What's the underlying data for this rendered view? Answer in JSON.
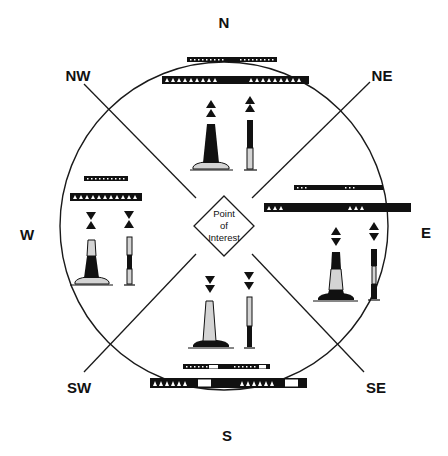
{
  "diagram": {
    "center_label": [
      "Point",
      "of",
      "Interest"
    ],
    "directions": {
      "N": "N",
      "NE": "NE",
      "E": "E",
      "SE": "SE",
      "S": "S",
      "SW": "SW",
      "W": "W",
      "NW": "NW"
    },
    "colors": {
      "line": "#1a1a1a",
      "fill_dark": "#111111",
      "fill_light": "#d4d4d4",
      "background": "#ffffff"
    },
    "sectors": [
      {
        "name": "north",
        "topmark": "two-cones-up",
        "buoy_pattern": "black-over-light",
        "light_bar_symbols": 18
      },
      {
        "name": "east",
        "topmark": "cones-base-to-base",
        "buoy_pattern": "black-light-black",
        "light_bar_groups": 3
      },
      {
        "name": "south",
        "topmark": "two-cones-down",
        "buoy_pattern": "light-over-black",
        "light_bar_groups": 6
      },
      {
        "name": "west",
        "topmark": "cones-point-to-point",
        "buoy_pattern": "light-black-light",
        "light_bar_symbols": 9
      }
    ]
  }
}
